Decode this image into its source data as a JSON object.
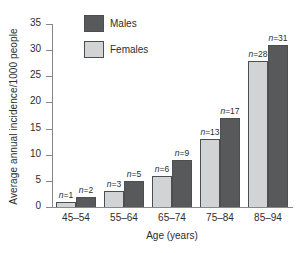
{
  "figure": {
    "background": "#ffffff"
  },
  "chart_data": {
    "type": "bar",
    "title": "",
    "xlabel": "Age (years)",
    "ylabel": "Average annual incidence/1000 people",
    "categories": [
      "45–54",
      "55–64",
      "65–74",
      "75–84",
      "85–94"
    ],
    "series": [
      {
        "name": "Males",
        "color": "#58595b",
        "values": [
          2,
          5,
          9,
          17,
          31
        ],
        "point_labels": [
          "n=2",
          "n=5",
          "n=9",
          "n=17",
          "n=31"
        ],
        "group_slot": 1
      },
      {
        "name": "Females",
        "color": "#d1d3d4",
        "values": [
          1,
          3,
          6,
          13,
          28
        ],
        "point_labels": [
          "n=1",
          "n=3",
          "n=6",
          "n=13",
          "n=28"
        ],
        "group_slot": 0
      }
    ],
    "ylim": [
      0,
      35
    ],
    "yticks": [
      0,
      5,
      10,
      15,
      20,
      25,
      30,
      35
    ],
    "grid": false,
    "legend_position": "upper-left-inside",
    "bar_edge_color": "#4d4e50",
    "axis_color": "#87888a",
    "text_color": "#2d2d2d"
  }
}
